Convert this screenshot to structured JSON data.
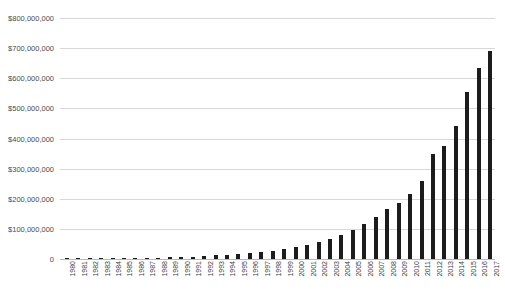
{
  "chart_data": {
    "type": "bar",
    "title": "",
    "title_note": "title row is cropped off the top edge of the screenshot and is not legible",
    "xlabel": "",
    "ylabel": "",
    "ylim": [
      0,
      800000000
    ],
    "ytick_values": [
      0,
      100000000,
      200000000,
      300000000,
      400000000,
      500000000,
      600000000,
      700000000,
      800000000
    ],
    "ytick_labels": [
      "0",
      "$100,000,000",
      "$200,000,000",
      "$300,000,000",
      "$400,000,000",
      "$500,000,000",
      "$600,000,000",
      "$700,000,000",
      "$800,000,000"
    ],
    "grid": true,
    "legend": false,
    "bar_color": "#1c1c1c",
    "grid_color": "#d8d8d8",
    "categories": [
      "1980",
      "1981",
      "1982",
      "1983",
      "1984",
      "1985",
      "1986",
      "1987",
      "1988",
      "1989",
      "1990",
      "1991",
      "1992",
      "1993",
      "1994",
      "1995",
      "1996",
      "1997",
      "1998",
      "1999",
      "2000",
      "2001",
      "2002",
      "2003",
      "2004",
      "2005",
      "2006",
      "2007",
      "2008",
      "2009",
      "2010",
      "2011",
      "2012",
      "2013",
      "2014",
      "2015",
      "2016",
      "2017"
    ],
    "values": [
      1000000,
      1000000,
      1500000,
      1500000,
      2000000,
      2500000,
      3000000,
      3500000,
      5000000,
      6000000,
      7000000,
      8000000,
      10000000,
      12000000,
      14000000,
      17000000,
      20000000,
      24000000,
      28000000,
      33000000,
      39000000,
      46000000,
      55000000,
      66000000,
      80000000,
      96000000,
      115000000,
      140000000,
      165000000,
      185000000,
      215000000,
      260000000,
      350000000,
      375000000,
      440000000,
      555000000,
      635000000,
      690000000
    ]
  }
}
